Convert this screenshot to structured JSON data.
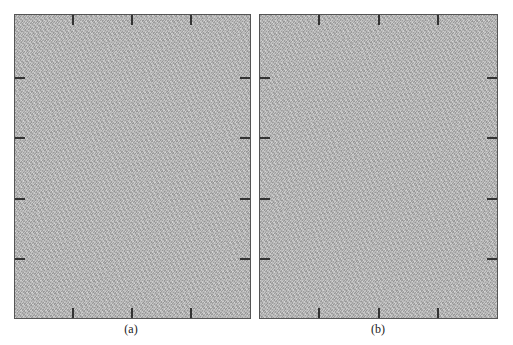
{
  "figure": {
    "panels": [
      {
        "id": "a",
        "caption": "(a)",
        "content": "grayscale noise texture",
        "fill_color": "#b9b9b9",
        "border_color": "#555555",
        "ticks": {
          "top": 3,
          "bottom": 3,
          "left": 4,
          "right": 4
        }
      },
      {
        "id": "b",
        "caption": "(b)",
        "content": "grayscale noise texture",
        "fill_color": "#b9b9b9",
        "border_color": "#555555",
        "ticks": {
          "top": 3,
          "bottom": 3,
          "left": 4,
          "right": 4
        }
      }
    ]
  }
}
